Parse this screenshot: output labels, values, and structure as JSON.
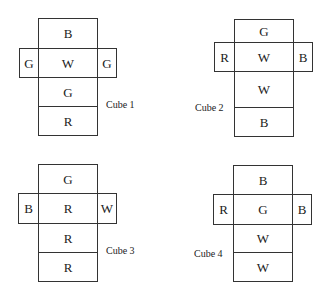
{
  "cubes": [
    {
      "label": "Cube 1",
      "faces": {
        "top": "B",
        "left": "G",
        "center": "W",
        "right": "G",
        "below": "G",
        "bottom": "R"
      }
    },
    {
      "label": "Cube 2",
      "faces": {
        "top": "G",
        "left": "R",
        "center": "W",
        "right": "B",
        "below": "W",
        "bottom": "B"
      }
    },
    {
      "label": "Cube 3",
      "faces": {
        "top": "G",
        "left": "B",
        "center": "R",
        "right": "W",
        "below": "R",
        "bottom": "R"
      }
    },
    {
      "label": "Cube 4",
      "faces": {
        "top": "B",
        "left": "R",
        "center": "G",
        "right": "B",
        "below": "W",
        "bottom": "W"
      }
    }
  ],
  "legend": {
    "B": "Blue",
    "G": "Green",
    "W": "White",
    "R": "Red"
  }
}
